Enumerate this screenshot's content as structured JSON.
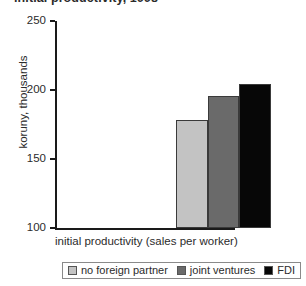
{
  "chart_data": {
    "type": "bar",
    "title": "initial productivity, 1998",
    "title_note": "title is cropped off at the top edge of the screenshot; only the bottom sliver of glyphs is visible",
    "categories": [
      "no foreign partner",
      "joint ventures",
      "FDI"
    ],
    "values": [
      178,
      196,
      204
    ],
    "series": [
      {
        "name": "initial productivity (sales per worker)",
        "values": [
          178,
          196,
          204
        ]
      }
    ],
    "xlabel": "initial productivity (sales per worker)",
    "ylabel": "koruny, thousands",
    "ylim": [
      100,
      250
    ],
    "yticks": [
      100,
      150,
      200,
      250
    ],
    "ytick_labels": [
      "100",
      "150",
      "200",
      "250"
    ],
    "xtick_labels": [],
    "grid": false,
    "legend_position": "bottom",
    "colors": [
      "#c3c3c3",
      "#6a6a6a",
      "#070707"
    ]
  },
  "legend": {
    "items": [
      {
        "label": "no foreign partner",
        "color": "#c3c3c3"
      },
      {
        "label": "joint ventures",
        "color": "#6a6a6a"
      },
      {
        "label": "FDI",
        "color": "#070707"
      }
    ]
  }
}
